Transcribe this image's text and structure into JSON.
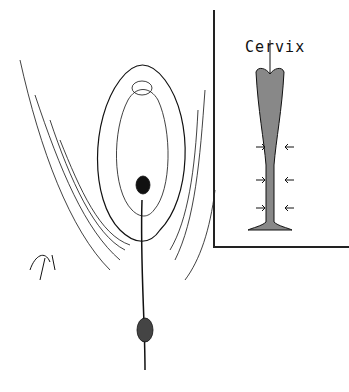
{
  "illustration": {
    "description": "Pen-and-ink anatomical drawing of external genitalia with inset diagram of vaginal canal",
    "inset_label": "Cervix",
    "colors": {
      "ink": "#111111",
      "paper": "#ffffff"
    }
  }
}
